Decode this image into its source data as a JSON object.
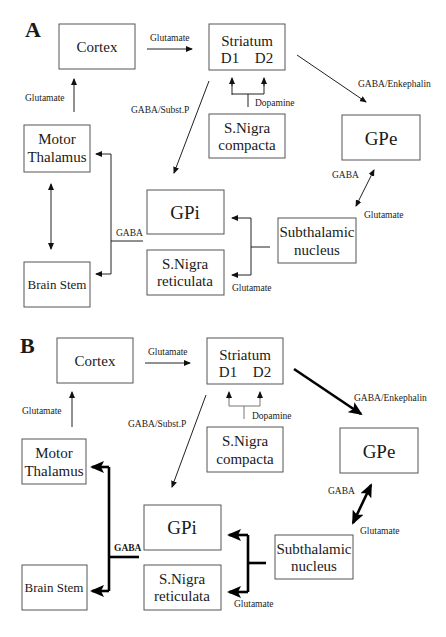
{
  "figure": {
    "panels": [
      {
        "id": "A",
        "label": "A",
        "nodes": {
          "cortex": "Cortex",
          "striatum_title": "Striatum",
          "striatum_d1": "D1",
          "striatum_d2": "D2",
          "snc_line1": "S.Nigra",
          "snc_line2": "compacta",
          "gpe": "GPe",
          "thalamus_line1": "Motor",
          "thalamus_line2": "Thalamus",
          "gpi": "GPi",
          "snr_line1": "S.Nigra",
          "snr_line2": "reticulata",
          "stn_line1": "Subthalamic",
          "stn_line2": "nucleus",
          "brainstem": "Brain Stem"
        },
        "edge_labels": {
          "cortex_striatum": "Glutamate",
          "thalamus_cortex": "Glutamate",
          "dopamine": "Dopamine",
          "striatum_gpe": "GABA/Enkephalin",
          "striatum_gpi": "GABA/Subst.P",
          "gpe_stn_gaba": "GABA",
          "gpe_stn_glutamate": "Glutamate",
          "gpi_output": "GABA",
          "stn_output": "Glutamate"
        }
      },
      {
        "id": "B",
        "label": "B",
        "nodes": {
          "cortex": "Cortex",
          "striatum_title": "Striatum",
          "striatum_d1": "D1",
          "striatum_d2": "D2",
          "snc_line1": "S.Nigra",
          "snc_line2": "compacta",
          "gpe": "GPe",
          "thalamus_line1": "Motor",
          "thalamus_line2": "Thalamus",
          "gpi": "GPi",
          "snr_line1": "S.Nigra",
          "snr_line2": "reticulata",
          "stn_line1": "Subthalamic",
          "stn_line2": "nucleus",
          "brainstem": "Brain Stem"
        },
        "edge_labels": {
          "cortex_striatum": "Glutamate",
          "thalamus_cortex": "Glutamate",
          "dopamine": "Dopamine",
          "striatum_gpe": "GABA/Enkephalin",
          "striatum_gpi": "GABA/Subst.P",
          "gpe_stn_gaba": "GABA",
          "gpe_stn_glutamate": "Glutamate",
          "gpi_output": "GABA",
          "stn_output": "Glutamate"
        }
      }
    ],
    "colors": {
      "line": "#222222",
      "box_border": "#555555",
      "dopamine_line_B": "#777777",
      "background": "#ffffff"
    }
  }
}
